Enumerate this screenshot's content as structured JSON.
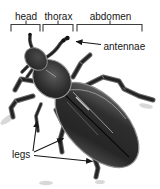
{
  "diagram": {
    "region_labels": {
      "head": "head",
      "thorax": "thorax",
      "abdomen": "abdomen"
    },
    "part_labels": {
      "antennae": "antennae",
      "legs": "legs"
    },
    "annotations": {
      "brackets": [
        "head",
        "thorax",
        "abdomen"
      ],
      "arrow_targets": [
        "antennae",
        "leg",
        "leg",
        "leg"
      ]
    },
    "colors": {
      "background": "#ffffff",
      "text": "#161616",
      "line": "#3d3d3d",
      "body_dark": "#1c1c1c",
      "body_mid": "#3c3c3c",
      "body_rim": "#9e9e9e",
      "shadow": "#d8d8d8"
    }
  }
}
